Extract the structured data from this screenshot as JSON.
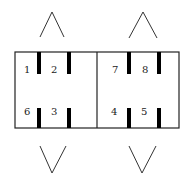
{
  "diagram": {
    "cells": [
      {
        "name": "left",
        "top_labels": [
          "1",
          "2"
        ],
        "bottom_labels": [
          "6",
          "3"
        ]
      },
      {
        "name": "right",
        "top_labels": [
          "7",
          "8"
        ],
        "bottom_labels": [
          "4",
          "5"
        ]
      }
    ],
    "arrows": {
      "top": [
        "up",
        "up"
      ],
      "bottom": [
        "down",
        "down"
      ]
    },
    "colors": {
      "line": "#222222",
      "bar": "#000000",
      "background": "#ffffff"
    }
  },
  "labels": {
    "p1": "1",
    "p2": "2",
    "p3": "3",
    "p4": "4",
    "p5": "5",
    "p6": "6",
    "p7": "7",
    "p8": "8"
  }
}
